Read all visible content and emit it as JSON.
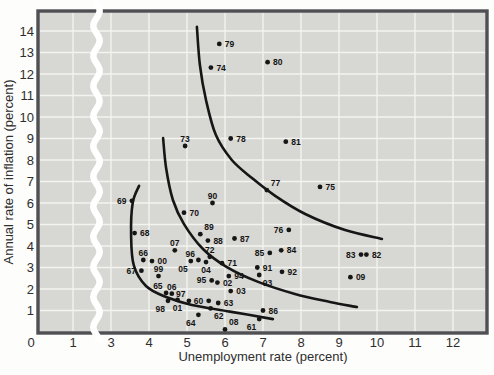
{
  "figure": {
    "type_note": "Phillips curve scatter plot of U.S. inflation vs unemployment by year"
  },
  "chart_data": {
    "type": "scatter",
    "title": "",
    "xlabel": "Unemployment rate (percent)",
    "ylabel": "Annual rate of inflation (percent)",
    "xlim": [
      0,
      12.9
    ],
    "ylim": [
      0,
      14.9
    ],
    "grid": "on",
    "axis_break_x": "between 1 and 3",
    "x_ticks": [
      {
        "label": "0",
        "value": 0
      },
      {
        "label": "1",
        "value": 1
      },
      {
        "label": "3",
        "value": 3
      },
      {
        "label": "4",
        "value": 4
      },
      {
        "label": "5",
        "value": 5
      },
      {
        "label": "6",
        "value": 6
      },
      {
        "label": "7",
        "value": 7
      },
      {
        "label": "8",
        "value": 8
      },
      {
        "label": "9",
        "value": 9
      },
      {
        "label": "10",
        "value": 10
      },
      {
        "label": "11",
        "value": 11
      },
      {
        "label": "12",
        "value": 12
      }
    ],
    "y_ticks": [
      {
        "label": "1",
        "value": 1
      },
      {
        "label": "2",
        "value": 2
      },
      {
        "label": "3",
        "value": 3
      },
      {
        "label": "4",
        "value": 4
      },
      {
        "label": "5",
        "value": 5
      },
      {
        "label": "6",
        "value": 6
      },
      {
        "label": "7",
        "value": 7
      },
      {
        "label": "8",
        "value": 8
      },
      {
        "label": "9",
        "value": 9
      },
      {
        "label": "10",
        "value": 10
      },
      {
        "label": "11",
        "value": 11
      },
      {
        "label": "12",
        "value": 12
      },
      {
        "label": "13",
        "value": 13
      },
      {
        "label": "14",
        "value": 14
      }
    ],
    "points": [
      {
        "year": "60",
        "u": 5.57,
        "i": 1.45,
        "side": "left"
      },
      {
        "year": "61",
        "u": 6.9,
        "i": 0.6,
        "side": "below-left"
      },
      {
        "year": "62",
        "u": 5.62,
        "i": 1.1,
        "side": "below-right"
      },
      {
        "year": "63",
        "u": 5.82,
        "i": 1.35,
        "side": "right"
      },
      {
        "year": "64",
        "u": 5.3,
        "i": 0.8,
        "side": "below-left"
      },
      {
        "year": "65",
        "u": 4.45,
        "i": 1.82,
        "side": "above-left"
      },
      {
        "year": "66",
        "u": 3.85,
        "i": 3.35,
        "side": "above"
      },
      {
        "year": "67",
        "u": 3.8,
        "i": 2.85,
        "side": "left"
      },
      {
        "year": "68",
        "u": 3.62,
        "i": 4.6,
        "side": "right"
      },
      {
        "year": "69",
        "u": 3.55,
        "i": 6.1,
        "side": "left"
      },
      {
        "year": "70",
        "u": 4.92,
        "i": 5.55,
        "side": "right"
      },
      {
        "year": "71",
        "u": 5.92,
        "i": 3.2,
        "side": "right"
      },
      {
        "year": "72",
        "u": 5.6,
        "i": 3.5,
        "side": "above"
      },
      {
        "year": "73",
        "u": 4.95,
        "i": 8.65,
        "side": "above"
      },
      {
        "year": "74",
        "u": 5.63,
        "i": 12.3,
        "side": "right"
      },
      {
        "year": "75",
        "u": 8.5,
        "i": 6.75,
        "side": "right"
      },
      {
        "year": "76",
        "u": 7.68,
        "i": 4.75,
        "side": "left"
      },
      {
        "year": "77",
        "u": 7.1,
        "i": 6.6,
        "side": "above-right"
      },
      {
        "year": "78",
        "u": 6.15,
        "i": 9.0,
        "side": "right"
      },
      {
        "year": "79",
        "u": 5.85,
        "i": 13.4,
        "side": "right"
      },
      {
        "year": "80",
        "u": 7.12,
        "i": 12.55,
        "side": "right"
      },
      {
        "year": "81",
        "u": 7.6,
        "i": 8.85,
        "side": "right"
      },
      {
        "year": "82",
        "u": 9.72,
        "i": 3.6,
        "side": "right"
      },
      {
        "year": "83",
        "u": 9.58,
        "i": 3.6,
        "side": "left"
      },
      {
        "year": "84",
        "u": 7.48,
        "i": 3.8,
        "side": "right"
      },
      {
        "year": "85",
        "u": 7.18,
        "i": 3.68,
        "side": "left"
      },
      {
        "year": "86",
        "u": 7.0,
        "i": 1.0,
        "side": "right"
      },
      {
        "year": "87",
        "u": 6.25,
        "i": 4.35,
        "side": "right"
      },
      {
        "year": "88",
        "u": 5.55,
        "i": 4.25,
        "side": "right"
      },
      {
        "year": "89",
        "u": 5.35,
        "i": 4.55,
        "side": "above-right"
      },
      {
        "year": "90",
        "u": 5.67,
        "i": 6.0,
        "side": "above"
      },
      {
        "year": "91",
        "u": 6.85,
        "i": 3.0,
        "side": "right"
      },
      {
        "year": "92",
        "u": 7.5,
        "i": 2.8,
        "side": "right"
      },
      {
        "year": "93",
        "u": 6.9,
        "i": 2.65,
        "side": "below-right"
      },
      {
        "year": "94",
        "u": 6.1,
        "i": 2.6,
        "side": "right"
      },
      {
        "year": "95",
        "u": 5.65,
        "i": 2.4,
        "side": "left"
      },
      {
        "year": "96",
        "u": 5.3,
        "i": 3.35,
        "side": "above-left"
      },
      {
        "year": "97",
        "u": 5.05,
        "i": 1.45,
        "side": "above-left"
      },
      {
        "year": "98",
        "u": 4.5,
        "i": 1.45,
        "side": "below-left"
      },
      {
        "year": "99",
        "u": 4.25,
        "i": 2.6,
        "side": "above"
      },
      {
        "year": "00",
        "u": 4.08,
        "i": 3.3,
        "side": "right"
      },
      {
        "year": "01",
        "u": 4.75,
        "i": 1.5,
        "side": "below"
      },
      {
        "year": "02",
        "u": 5.8,
        "i": 2.3,
        "side": "right"
      },
      {
        "year": "03",
        "u": 6.15,
        "i": 1.9,
        "side": "right"
      },
      {
        "year": "04",
        "u": 5.5,
        "i": 3.25,
        "side": "below"
      },
      {
        "year": "05",
        "u": 5.1,
        "i": 3.3,
        "side": "below-left"
      },
      {
        "year": "06",
        "u": 4.6,
        "i": 1.78,
        "side": "above"
      },
      {
        "year": "07",
        "u": 4.68,
        "i": 3.8,
        "side": "above"
      },
      {
        "year": "08",
        "u": 6.0,
        "i": 0.12,
        "side": "above-right"
      },
      {
        "year": "09",
        "u": 9.3,
        "i": 2.55,
        "side": "right"
      }
    ],
    "curves": [
      {
        "name": "short-run-phillips-curve-1",
        "pts": [
          [
            3.74,
            6.8
          ],
          [
            3.57,
            6.0
          ],
          [
            3.53,
            4.5
          ],
          [
            3.6,
            3.1
          ],
          [
            3.92,
            2.14
          ],
          [
            4.45,
            1.63
          ],
          [
            5.13,
            1.26
          ],
          [
            6.13,
            0.95
          ],
          [
            7.26,
            0.6
          ]
        ]
      },
      {
        "name": "short-run-phillips-curve-2",
        "pts": [
          [
            4.37,
            9.02
          ],
          [
            4.45,
            7.63
          ],
          [
            4.63,
            6.14
          ],
          [
            4.92,
            5.02
          ],
          [
            5.42,
            3.86
          ],
          [
            6.05,
            3.02
          ],
          [
            6.87,
            2.33
          ],
          [
            7.84,
            1.77
          ],
          [
            8.76,
            1.4
          ],
          [
            9.47,
            1.16
          ]
        ]
      },
      {
        "name": "short-run-phillips-curve-3",
        "pts": [
          [
            5.26,
            14.19
          ],
          [
            5.34,
            12.42
          ],
          [
            5.5,
            10.79
          ],
          [
            5.76,
            9.16
          ],
          [
            6.18,
            8.0
          ],
          [
            6.71,
            7.16
          ],
          [
            7.32,
            6.33
          ],
          [
            8.11,
            5.49
          ],
          [
            9.16,
            4.74
          ],
          [
            10.13,
            4.33
          ]
        ]
      }
    ],
    "colors": {
      "plot_background": "#d7d7d3",
      "gridline": "#f3f3f0",
      "frame": "#4f4f54",
      "ink": "#161616",
      "tick_text": "#2e2e2e",
      "axis_break": "#ffffff"
    }
  }
}
